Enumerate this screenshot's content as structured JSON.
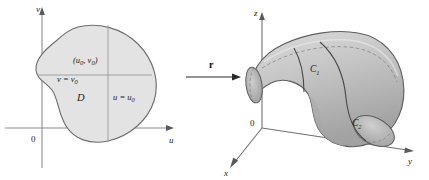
{
  "figure": {
    "background_color": "#ffffff",
    "line_color": "#4a4a4a",
    "ink_color": "#1a1a1a"
  },
  "uv_plane": {
    "axis_v_label": "v",
    "axis_u_label": "u",
    "origin_label": "0",
    "region_label": "D",
    "region_fill": "#e3e3e3",
    "region_stroke": "#6e6e6e",
    "point_label": "(u",
    "point_label_sub1": "0",
    "point_label_mid": ", v",
    "point_label_sub2": "0",
    "point_label_close": ")",
    "gridline_v_label": "v = v",
    "gridline_v_sub": "0",
    "gridline_u_label": "u = u",
    "gridline_u_sub": "0",
    "gridline_color": "#9a9a9a",
    "axis_color": "#8c8c8c"
  },
  "mapping": {
    "arrow_label": "r",
    "arrow_color": "#2b2b2b",
    "description": "vector-valued function r maps D onto the surface"
  },
  "xyz_space": {
    "axis_z_label": "z",
    "axis_y_label": "y",
    "axis_x_label": "x",
    "origin_label": "0",
    "curve_c1_label": "C",
    "curve_c1_sub": "1",
    "curve_c2_label": "C",
    "curve_c2_sub": "2",
    "surface_fill_light": "#d6d6d6",
    "surface_fill_mid": "#b8b8b8",
    "surface_fill_dark": "#9c9c9c",
    "surface_stroke": "#5e5e5e",
    "axis_color": "#6f6f6f",
    "curve_color": "#4a4a4a"
  }
}
